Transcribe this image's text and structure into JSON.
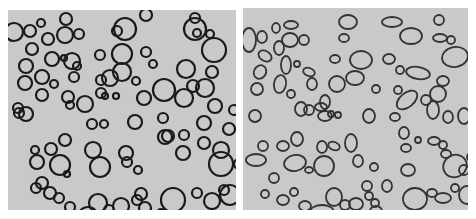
{
  "figure": {
    "background": "#ffffff",
    "panel_fill": "#c9c9c9",
    "stroke_left": "#1a1a1a",
    "stroke_right": "#333333",
    "panels": [
      {
        "id": "left",
        "shape": "circles",
        "stroke_width": 2.2,
        "items": [
          [
            6,
            22,
            9
          ],
          [
            22,
            21,
            6
          ],
          [
            33,
            13,
            4
          ],
          [
            58,
            9,
            6
          ],
          [
            57,
            25,
            8
          ],
          [
            71,
            24,
            5
          ],
          [
            40,
            29,
            6
          ],
          [
            24,
            39,
            6
          ],
          [
            64,
            51,
            8
          ],
          [
            44,
            49,
            7
          ],
          [
            56,
            48,
            3
          ],
          [
            69,
            56,
            4
          ],
          [
            18,
            56,
            7
          ],
          [
            17,
            73,
            7
          ],
          [
            34,
            67,
            7
          ],
          [
            66,
            67,
            5
          ],
          [
            46,
            74,
            4
          ],
          [
            92,
            45,
            5
          ],
          [
            114,
            44,
            10
          ],
          [
            117,
            19,
            11
          ],
          [
            109,
            21,
            5
          ],
          [
            138,
            5,
            6
          ],
          [
            187,
            19,
            11
          ],
          [
            187,
            8,
            5
          ],
          [
            189,
            23,
            4
          ],
          [
            202,
            24,
            4
          ],
          [
            206,
            40,
            12
          ],
          [
            178,
            59,
            9
          ],
          [
            204,
            62,
            6
          ],
          [
            138,
            42,
            5
          ],
          [
            145,
            54,
            4
          ],
          [
            114,
            62,
            9
          ],
          [
            93,
            70,
            5
          ],
          [
            102,
            68,
            8
          ],
          [
            128,
            71,
            4
          ],
          [
            156,
            80,
            11
          ],
          [
            185,
            76,
            6
          ],
          [
            197,
            78,
            9
          ],
          [
            34,
            85,
            6
          ],
          [
            60,
            87,
            6
          ],
          [
            93,
            83,
            5
          ],
          [
            97,
            86,
            3
          ],
          [
            108,
            86,
            3
          ],
          [
            136,
            88,
            7
          ],
          [
            176,
            88,
            9
          ],
          [
            207,
            96,
            7
          ],
          [
            226,
            100,
            5
          ],
          [
            10,
            98,
            5
          ],
          [
            62,
            95,
            4
          ],
          [
            77,
            94,
            8
          ],
          [
            11,
            103,
            5
          ],
          [
            18,
            104,
            7
          ],
          [
            84,
            114,
            5
          ],
          [
            96,
            114,
            4
          ],
          [
            127,
            112,
            7
          ],
          [
            155,
            108,
            5
          ],
          [
            196,
            113,
            7
          ],
          [
            221,
            119,
            6
          ],
          [
            157,
            127,
            7
          ],
          [
            176,
            125,
            5
          ],
          [
            160,
            126,
            6
          ],
          [
            196,
            133,
            6
          ],
          [
            85,
            140,
            8
          ],
          [
            213,
            140,
            8
          ],
          [
            27,
            140,
            4
          ],
          [
            43,
            139,
            6
          ],
          [
            57,
            130,
            6
          ],
          [
            29,
            152,
            7
          ],
          [
            52,
            155,
            10
          ],
          [
            59,
            164,
            3
          ],
          [
            92,
            157,
            10
          ],
          [
            118,
            143,
            7
          ],
          [
            119,
            152,
            5
          ],
          [
            130,
            160,
            4
          ],
          [
            175,
            143,
            7
          ],
          [
            213,
            154,
            12
          ],
          [
            231,
            154,
            5
          ],
          [
            28,
            178,
            5
          ],
          [
            34,
            173,
            6
          ],
          [
            51,
            188,
            5
          ],
          [
            42,
            183,
            6
          ],
          [
            62,
            197,
            5
          ],
          [
            90,
            193,
            9
          ],
          [
            101,
            200,
            5
          ],
          [
            113,
            196,
            8
          ],
          [
            129,
            190,
            5
          ],
          [
            133,
            184,
            6
          ],
          [
            137,
            198,
            6
          ],
          [
            165,
            190,
            12
          ],
          [
            189,
            183,
            5
          ],
          [
            204,
            191,
            8
          ],
          [
            222,
            185,
            10
          ],
          [
            216,
            180,
            5
          ],
          [
            80,
            207,
            10
          ],
          [
            153,
            203,
            4
          ],
          [
            123,
            210,
            5
          ]
        ]
      },
      {
        "id": "right",
        "shape": "ellipses",
        "stroke_width": 1.8,
        "items": [
          [
            6,
            32,
            7,
            12,
            0
          ],
          [
            19,
            29,
            5,
            6,
            0
          ],
          [
            33,
            20,
            4,
            5,
            0
          ],
          [
            48,
            17,
            7,
            4,
            0
          ],
          [
            47,
            32,
            8,
            7,
            0
          ],
          [
            61,
            32,
            5,
            5,
            0
          ],
          [
            22,
            48,
            7,
            5,
            30
          ],
          [
            36,
            40,
            5,
            7,
            0
          ],
          [
            43,
            57,
            5,
            9,
            0
          ],
          [
            54,
            56,
            3,
            3,
            0
          ],
          [
            66,
            64,
            6,
            4,
            20
          ],
          [
            17,
            64,
            6,
            7,
            30
          ],
          [
            14,
            81,
            6,
            6,
            0
          ],
          [
            37,
            76,
            6,
            9,
            10
          ],
          [
            69,
            76,
            5,
            6,
            0
          ],
          [
            48,
            86,
            4,
            4,
            0
          ],
          [
            58,
            101,
            6,
            7,
            0
          ],
          [
            78,
            99,
            6,
            4,
            0
          ],
          [
            88,
            106,
            3,
            3,
            0
          ],
          [
            95,
            107,
            3,
            3,
            0
          ],
          [
            82,
            94,
            5,
            7,
            0
          ],
          [
            105,
            14,
            9,
            7,
            0
          ],
          [
            101,
            30,
            5,
            4,
            0
          ],
          [
            118,
            52,
            11,
            9,
            0
          ],
          [
            149,
            14,
            10,
            5,
            0
          ],
          [
            146,
            51,
            6,
            5,
            0
          ],
          [
            157,
            62,
            4,
            4,
            0
          ],
          [
            92,
            51,
            5,
            4,
            0
          ],
          [
            112,
            70,
            9,
            7,
            0
          ],
          [
            94,
            76,
            8,
            8,
            0
          ],
          [
            133,
            81,
            4,
            4,
            0
          ],
          [
            155,
            82,
            4,
            4,
            0
          ],
          [
            168,
            28,
            11,
            8,
            0
          ],
          [
            196,
            12,
            5,
            5,
            0
          ],
          [
            197,
            30,
            7,
            4,
            0
          ],
          [
            208,
            32,
            4,
            4,
            0
          ],
          [
            212,
            49,
            13,
            10,
            -10
          ],
          [
            175,
            65,
            12,
            6,
            10
          ],
          [
            200,
            73,
            6,
            5,
            0
          ],
          [
            195,
            86,
            8,
            8,
            0
          ],
          [
            164,
            92,
            12,
            7,
            -40
          ],
          [
            183,
            92,
            5,
            5,
            0
          ],
          [
            190,
            102,
            6,
            9,
            0
          ],
          [
            12,
            108,
            6,
            6,
            0
          ],
          [
            66,
            102,
            5,
            5,
            0
          ],
          [
            82,
            108,
            7,
            5,
            0
          ],
          [
            126,
            108,
            6,
            7,
            0
          ],
          [
            152,
            109,
            5,
            4,
            0
          ],
          [
            205,
            109,
            5,
            6,
            0
          ],
          [
            221,
            108,
            6,
            8,
            0
          ],
          [
            161,
            125,
            5,
            6,
            0
          ],
          [
            163,
            140,
            5,
            4,
            0
          ],
          [
            175,
            132,
            3,
            3,
            0
          ],
          [
            191,
            133,
            6,
            4,
            0
          ],
          [
            200,
            137,
            4,
            4,
            0
          ],
          [
            203,
            146,
            5,
            4,
            0
          ],
          [
            20,
            138,
            5,
            5,
            0
          ],
          [
            40,
            138,
            6,
            5,
            0
          ],
          [
            54,
            131,
            6,
            7,
            0
          ],
          [
            79,
            139,
            5,
            6,
            0
          ],
          [
            91,
            138,
            6,
            4,
            20
          ],
          [
            108,
            135,
            6,
            9,
            0
          ],
          [
            115,
            153,
            5,
            6,
            0
          ],
          [
            131,
            159,
            4,
            4,
            0
          ],
          [
            13,
            152,
            10,
            6,
            0
          ],
          [
            52,
            155,
            11,
            8,
            -10
          ],
          [
            66,
            162,
            4,
            3,
            0
          ],
          [
            81,
            158,
            10,
            10,
            0
          ],
          [
            124,
            178,
            5,
            5,
            0
          ],
          [
            144,
            178,
            5,
            6,
            0
          ],
          [
            165,
            162,
            7,
            6,
            0
          ],
          [
            212,
            158,
            12,
            11,
            -30
          ],
          [
            228,
            149,
            4,
            4,
            0
          ],
          [
            221,
            162,
            5,
            5,
            0
          ],
          [
            31,
            170,
            5,
            5,
            0
          ],
          [
            22,
            186,
            4,
            4,
            0
          ],
          [
            40,
            192,
            6,
            5,
            0
          ],
          [
            51,
            184,
            4,
            4,
            0
          ],
          [
            62,
            198,
            6,
            5,
            0
          ],
          [
            79,
            204,
            12,
            7,
            0
          ],
          [
            91,
            189,
            8,
            9,
            0
          ],
          [
            102,
            197,
            5,
            5,
            0
          ],
          [
            113,
            196,
            7,
            6,
            0
          ],
          [
            126,
            188,
            4,
            4,
            0
          ],
          [
            132,
            195,
            4,
            4,
            0
          ],
          [
            133,
            203,
            6,
            5,
            0
          ],
          [
            172,
            191,
            12,
            11,
            0
          ],
          [
            189,
            185,
            5,
            4,
            0
          ],
          [
            200,
            190,
            8,
            5,
            0
          ],
          [
            212,
            180,
            4,
            4,
            0
          ],
          [
            224,
            187,
            8,
            9,
            0
          ]
        ]
      }
    ]
  }
}
